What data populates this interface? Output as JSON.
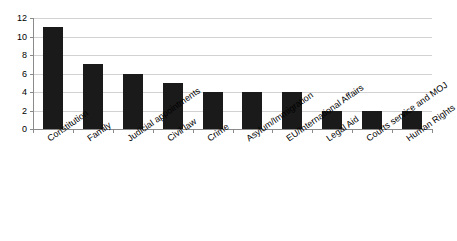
{
  "chart_data": {
    "type": "bar",
    "title": "",
    "xlabel": "",
    "ylabel": "",
    "ylim": [
      0,
      12
    ],
    "ytick_step": 2,
    "yticks": [
      0,
      2,
      4,
      6,
      8,
      10,
      12
    ],
    "grid": true,
    "legend": false,
    "bar_color": "#1a1a1a",
    "gridline_color": "#d2d2d2",
    "axis_color": "#8a8a8a",
    "categories": [
      "Constitution",
      "Family",
      "Judicial appointments",
      "Civil law",
      "Crime",
      "Asylum/Immigration",
      "EU/International Affairs",
      "Legal Aid",
      "Courts service and MOJ",
      "Human Rights"
    ],
    "values": [
      11,
      7,
      6,
      5,
      4,
      4,
      4,
      2,
      2,
      2
    ]
  }
}
